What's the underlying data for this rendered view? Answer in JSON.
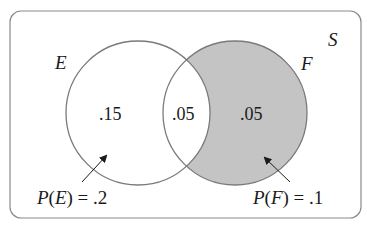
{
  "diagram": {
    "type": "venn",
    "sample_space_label": "S",
    "sets": [
      {
        "name": "E",
        "label": "E",
        "shaded": false
      },
      {
        "name": "F",
        "label": "F",
        "shaded": true
      }
    ],
    "regions": {
      "e_only": ".15",
      "e_and_f": ".05",
      "f_only": ".05"
    },
    "annotations": {
      "pe": {
        "prefix": "P(",
        "set": "E",
        "suffix": ") = .2"
      },
      "pf": {
        "prefix": "P(",
        "set": "F",
        "suffix": ") = .1"
      }
    },
    "colors": {
      "border": "#8a8a8a",
      "circle_stroke": "#7a7a7a",
      "shade": "#c4c4c4",
      "text": "#1a1a1a"
    }
  }
}
